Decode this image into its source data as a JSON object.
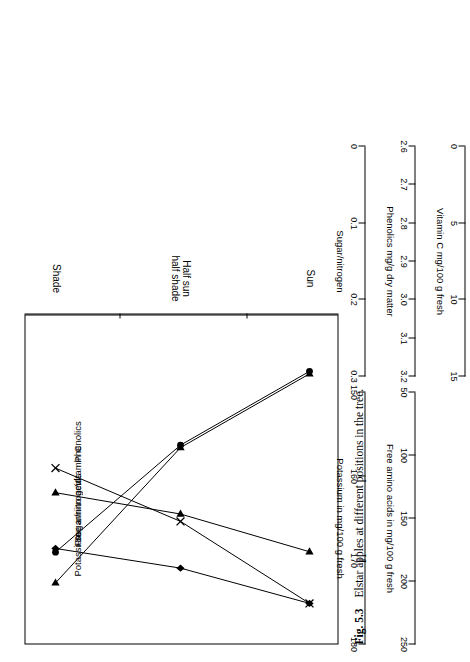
{
  "caption": {
    "figure_number": "Fig. 5.3",
    "text": "Elstar apples at different positions in the tree."
  },
  "chart_data": {
    "type": "line",
    "title": "Elstar apples at different positions in the tree.",
    "xlabel": "",
    "categories": [
      "Sun",
      "Half sun\nhalf shade",
      "Shade"
    ],
    "category_labels": [
      {
        "line1": "Sun",
        "line2": ""
      },
      {
        "line1": "Half sun",
        "line2": "half shade"
      },
      {
        "line1": "Shade",
        "line2": ""
      }
    ],
    "grid": false,
    "legend": "inline-end-labels",
    "series": [
      {
        "name": "Potassium",
        "marker": "triangle",
        "axis": "potassium",
        "values": [
          151.5,
          160.5,
          177.0
        ]
      },
      {
        "name": "Free amino acids",
        "marker": "circle",
        "axis": "free_amino_acids",
        "values": [
          58,
          118,
          205
        ]
      },
      {
        "name": "Sugar/nitrogen",
        "marker": "diamond",
        "axis": "sugar_nitrogen",
        "values": [
          0.295,
          0.252,
          0.228
        ]
      },
      {
        "name": "Phenolics",
        "marker": "x",
        "axis": "phenolics",
        "values": [
          3.19,
          2.99,
          2.86
        ]
      },
      {
        "name": "Vitamin C",
        "marker": "triangle",
        "axis": "vitamin_c",
        "values": [
          11.6,
          9.3,
          8.0
        ]
      }
    ],
    "axes": [
      {
        "id": "potassium",
        "title": "Potassium in mg/100 g fresh",
        "ticks": [
          "180",
          "170",
          "160",
          "150"
        ],
        "min": 150,
        "max": 180,
        "reversed": true
      },
      {
        "id": "free_amino_acids",
        "title": "Free amino acids in mg/100 g fresh",
        "ticks": [
          "250",
          "200",
          "150",
          "100",
          "50"
        ],
        "min": 50,
        "max": 250,
        "reversed": true
      },
      {
        "id": "sugar_nitrogen",
        "title": "Sugar/nitrogen",
        "ticks": [
          "0.3",
          "0.2",
          "0.1",
          "0"
        ],
        "min": 0,
        "max": 0.3,
        "reversed": true
      },
      {
        "id": "phenolics",
        "title": "Phenolics mg/g dry matter",
        "ticks": [
          "3.2",
          "3.1",
          "3.0",
          "2.9",
          "2.8",
          "2.7",
          "2.6"
        ],
        "min": 2.6,
        "max": 3.2,
        "reversed": true
      },
      {
        "id": "vitamin_c",
        "title": "Vitamin C mg/100 g fresh",
        "ticks": [
          "15",
          "10",
          "5",
          "0"
        ],
        "min": 0,
        "max": 15,
        "reversed": true
      }
    ]
  },
  "colors": {
    "ink": "#000000",
    "page": "#ffffff"
  }
}
